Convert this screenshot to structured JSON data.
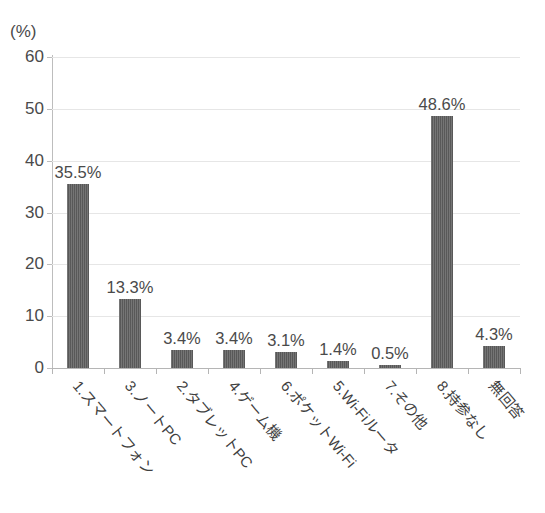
{
  "chart_data": {
    "type": "bar",
    "title": "",
    "subtitle": "",
    "xlabel": "",
    "ylabel": "",
    "unit_label": "(%)",
    "categories": [
      "1.スマートフォン",
      "3.ノートPC",
      "2.タブレットPC",
      "4.ゲーム機",
      "6.ポケットWi-Fi",
      "5.Wi-Fiルータ",
      "7.その他",
      "8.持参なし",
      "無回答"
    ],
    "values": [
      35.5,
      13.3,
      3.4,
      3.4,
      3.1,
      1.4,
      0.5,
      48.6,
      4.3
    ],
    "data_labels": [
      "35.5%",
      "13.3%",
      "3.4%",
      "3.4%",
      "3.1%",
      "1.4%",
      "0.5%",
      "48.6%",
      "4.3%"
    ],
    "ylim": [
      0,
      60
    ],
    "yticks": [
      0,
      10,
      20,
      30,
      40,
      50,
      60
    ],
    "ytick_labels": [
      "0",
      "10",
      "20",
      "30",
      "40",
      "50",
      "60"
    ],
    "grid": true,
    "legend": null,
    "bar_color": "#5e5e5e",
    "grid_color": "#e6e6e6",
    "axis_color": "#b5b5b5",
    "text_color": "#4a4a4a",
    "background": "#ffffff"
  }
}
